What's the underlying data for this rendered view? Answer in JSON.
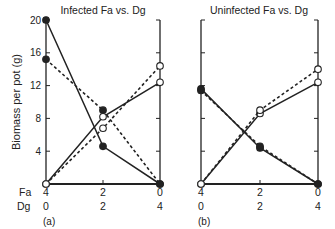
{
  "figure": {
    "ylabel": "Biomass per pot (g)",
    "row_label_fa": "Fa",
    "row_label_dg": "Dg",
    "yticks": [
      "20",
      "16",
      "12",
      "8",
      "4"
    ],
    "xticks_fa": [
      "4",
      "2",
      "0"
    ],
    "xticks_dg": [
      "0",
      "2",
      "4"
    ]
  },
  "panels": [
    {
      "title": "Infected Fa vs. Dg",
      "label": "(a)"
    },
    {
      "title": "Uninfected Fa vs. Dg",
      "label": "(b)"
    }
  ],
  "chart_data": [
    {
      "type": "line",
      "title": "Infected Fa vs. Dg",
      "panel_label": "(a)",
      "xlabel": "Fa / Dg planting ratio",
      "ylabel": "Biomass per pot (g)",
      "categories": [
        "Fa4:Dg0",
        "Fa2:Dg2",
        "Fa0:Dg4"
      ],
      "x_tick_labels": {
        "Fa": [
          "4",
          "2",
          "0"
        ],
        "Dg": [
          "0",
          "2",
          "4"
        ]
      },
      "ylim": [
        0,
        20
      ],
      "yticks": [
        4,
        8,
        12,
        16,
        20
      ],
      "grid": false,
      "series": [
        {
          "name": "filled-solid",
          "marker": "filled",
          "line": "solid",
          "values": [
            20.0,
            4.6,
            0.0
          ]
        },
        {
          "name": "filled-dashed",
          "marker": "filled",
          "line": "dashed",
          "values": [
            15.2,
            9.0,
            0.0
          ]
        },
        {
          "name": "open-solid",
          "marker": "open",
          "line": "solid",
          "values": [
            0.0,
            8.2,
            12.4
          ]
        },
        {
          "name": "open-dashed",
          "marker": "open",
          "line": "dashed",
          "values": [
            0.0,
            6.8,
            14.4
          ]
        }
      ]
    },
    {
      "type": "line",
      "title": "Uninfected Fa vs. Dg",
      "panel_label": "(b)",
      "xlabel": "Fa / Dg planting ratio",
      "ylabel": "Biomass per pot (g)",
      "categories": [
        "Fa4:Dg0",
        "Fa2:Dg2",
        "Fa0:Dg4"
      ],
      "x_tick_labels": {
        "Fa": [
          "4",
          "2",
          "0"
        ],
        "Dg": [
          "0",
          "2",
          "4"
        ]
      },
      "ylim": [
        0,
        20
      ],
      "yticks": [
        4,
        8,
        12,
        16,
        20
      ],
      "grid": false,
      "series": [
        {
          "name": "filled-solid",
          "marker": "filled",
          "line": "solid",
          "values": [
            11.6,
            4.4,
            0.0
          ]
        },
        {
          "name": "filled-dashed",
          "marker": "filled",
          "line": "dashed",
          "values": [
            11.4,
            4.6,
            0.0
          ]
        },
        {
          "name": "open-solid",
          "marker": "open",
          "line": "solid",
          "values": [
            0.0,
            8.6,
            12.4
          ]
        },
        {
          "name": "open-dashed",
          "marker": "open",
          "line": "dashed",
          "values": [
            0.0,
            9.0,
            14.0
          ]
        }
      ]
    }
  ]
}
